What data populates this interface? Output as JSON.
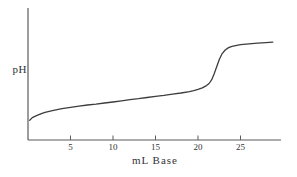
{
  "figure": {
    "kind": "titration-curve-figure",
    "background": "#ffffff"
  },
  "chart_data": {
    "type": "line",
    "title": "",
    "xlabel": "mL Base",
    "ylabel": "pH",
    "x_ticks": [
      5,
      10,
      15,
      20,
      25
    ],
    "x_range": [
      0,
      30
    ],
    "y_axis_note": "y-axis (pH) has no numeric tick labels; values below are relative height 0-1 of the plotted axis",
    "equivalence_point_mL": 22,
    "series": [
      {
        "name": "titration curve",
        "points": [
          [
            0.2,
            0.15
          ],
          [
            0.5,
            0.17
          ],
          [
            1.0,
            0.185
          ],
          [
            1.5,
            0.198
          ],
          [
            2.0,
            0.21
          ],
          [
            3.0,
            0.225
          ],
          [
            4.0,
            0.238
          ],
          [
            5.0,
            0.248
          ],
          [
            6.0,
            0.257
          ],
          [
            7.0,
            0.265
          ],
          [
            8.0,
            0.272
          ],
          [
            9.0,
            0.28
          ],
          [
            10.0,
            0.288
          ],
          [
            11.0,
            0.296
          ],
          [
            12.0,
            0.305
          ],
          [
            13.0,
            0.313
          ],
          [
            14.0,
            0.322
          ],
          [
            15.0,
            0.33
          ],
          [
            16.0,
            0.338
          ],
          [
            17.0,
            0.347
          ],
          [
            18.0,
            0.356
          ],
          [
            19.0,
            0.367
          ],
          [
            19.5,
            0.374
          ],
          [
            20.0,
            0.383
          ],
          [
            20.5,
            0.395
          ],
          [
            21.0,
            0.412
          ],
          [
            21.3,
            0.428
          ],
          [
            21.6,
            0.455
          ],
          [
            21.9,
            0.5
          ],
          [
            22.2,
            0.555
          ],
          [
            22.5,
            0.61
          ],
          [
            22.8,
            0.65
          ],
          [
            23.2,
            0.682
          ],
          [
            23.6,
            0.7
          ],
          [
            24.0,
            0.71
          ],
          [
            25.0,
            0.722
          ],
          [
            26.0,
            0.728
          ],
          [
            27.0,
            0.733
          ],
          [
            28.0,
            0.738
          ],
          [
            28.8,
            0.742
          ]
        ]
      }
    ],
    "colors": {
      "axis": "#5a5a5a",
      "curve": "#3d3d3d",
      "text": "#333333"
    },
    "legend": "none",
    "grid": "off"
  }
}
